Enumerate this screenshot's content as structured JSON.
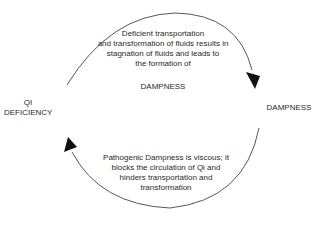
{
  "diagram": {
    "nodes": {
      "left": [
        "QI",
        "DEFICIENCY"
      ],
      "right": "DAMPNESS"
    },
    "top_arrow": {
      "direction": "left-to-right (clockwise)",
      "lines": [
        "Deficient transportation",
        "and transformation of fluids results in",
        "stagnation of fluids and leads to",
        "the formation of"
      ],
      "label": "DAMPNESS"
    },
    "bottom_arrow": {
      "direction": "right-to-left (clockwise)",
      "lines": [
        "Pathogenic Dampness is viscous; it",
        "blocks the circulation of Qi and",
        "hinders transportation and",
        "transformation"
      ]
    },
    "colors": {
      "line": "#444444",
      "text": "#2a2a2a",
      "background": "#ffffff"
    }
  }
}
